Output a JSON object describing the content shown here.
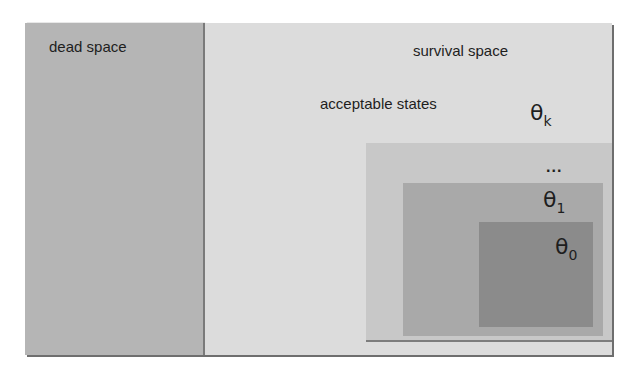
{
  "diagram": {
    "regions": {
      "dead_space": {
        "label": "dead space",
        "color": "#b5b5b5"
      },
      "survival_space": {
        "label": "survival space",
        "color": "#dcdcdc"
      },
      "acceptable_states": {
        "label": "acceptable states"
      }
    },
    "nested_sets": [
      {
        "symbol": "θ",
        "subscript": "k",
        "color": "#c8c8c8"
      },
      {
        "symbol": "...",
        "subscript": ""
      },
      {
        "symbol": "θ",
        "subscript": "1",
        "color": "#a9a9a9"
      },
      {
        "symbol": "θ",
        "subscript": "0",
        "color": "#8b8b8b"
      }
    ]
  }
}
